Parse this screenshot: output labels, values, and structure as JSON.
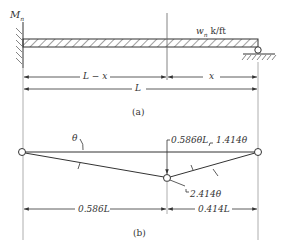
{
  "figure_a": {
    "moment_label": "M",
    "moment_sub": "n",
    "load_label_w": "w",
    "load_label_sub": "n",
    "load_units": " k/ft",
    "dim_left": "L − x",
    "dim_right": "x",
    "dim_total": "L",
    "caption": "(a)"
  },
  "figure_b": {
    "theta_label": "θ",
    "deflection_label": "0.586θL",
    "rotation_right": "1.414θ",
    "rotation_mid": "2.414θ",
    "dim_left": "0.586L",
    "dim_right": "0.414L",
    "caption": "(b)"
  },
  "colors": {
    "line": "#333333",
    "light": "#999999"
  }
}
